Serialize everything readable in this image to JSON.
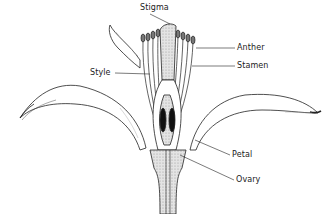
{
  "diagram": {
    "labels": {
      "stigma": "Stigma",
      "anther": "Anther",
      "stamen": "Stamen",
      "style": "Style",
      "petal": "Petal",
      "ovary": "Ovary"
    },
    "colors": {
      "line": "#222222",
      "fill_pistil": "#cfcfcf",
      "ovule": "#111111",
      "background": "#ffffff"
    }
  }
}
